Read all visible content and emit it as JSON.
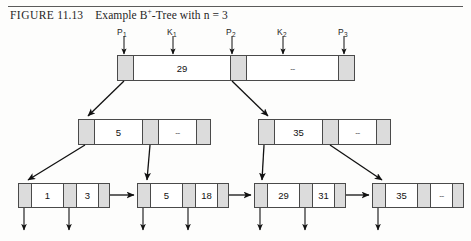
{
  "caption": {
    "figure_word": "FIGURE",
    "figure_number": "11.13",
    "title_pre": "Example B",
    "title_sup": "+",
    "title_post": "-Tree with n = 3"
  },
  "pointer_labels": [
    {
      "name": "P1",
      "text": "P",
      "sub": "1",
      "x": 117,
      "y": 27
    },
    {
      "name": "K1",
      "text": "K",
      "sub": "1",
      "x": 167,
      "y": 27
    },
    {
      "name": "P2",
      "text": "P",
      "sub": "2",
      "x": 226,
      "y": 27
    },
    {
      "name": "K2",
      "text": "K",
      "sub": "2",
      "x": 277,
      "y": 27
    },
    {
      "name": "P3",
      "text": "P",
      "sub": "3",
      "x": 338,
      "y": 27
    }
  ],
  "root": {
    "name": "root-node",
    "x": 117,
    "y": 55,
    "width": 238,
    "height": 26,
    "cells": [
      {
        "kind": "ptr",
        "label": "",
        "width": 16
      },
      {
        "kind": "val",
        "label": "29",
        "width": 97
      },
      {
        "kind": "ptr",
        "label": "",
        "width": 16
      },
      {
        "kind": "dash",
        "label": "--",
        "width": 92
      },
      {
        "kind": "ptr",
        "label": "",
        "width": 15
      }
    ]
  },
  "internal_nodes": [
    {
      "name": "internal-node-left",
      "x": 78,
      "y": 119,
      "width": 133,
      "height": 26,
      "cells": [
        {
          "kind": "ptr",
          "label": "",
          "width": 16
        },
        {
          "kind": "val",
          "label": "5",
          "width": 48
        },
        {
          "kind": "ptr",
          "label": "",
          "width": 16
        },
        {
          "kind": "dash",
          "label": "--",
          "width": 38
        },
        {
          "kind": "ptr",
          "label": "",
          "width": 13
        }
      ]
    },
    {
      "name": "internal-node-right",
      "x": 258,
      "y": 119,
      "width": 133,
      "height": 26,
      "cells": [
        {
          "kind": "ptr",
          "label": "",
          "width": 16
        },
        {
          "kind": "val",
          "label": "35",
          "width": 48
        },
        {
          "kind": "ptr",
          "label": "",
          "width": 16
        },
        {
          "kind": "dash",
          "label": "--",
          "width": 38
        },
        {
          "kind": "ptr",
          "label": "",
          "width": 13
        }
      ]
    }
  ],
  "leaf_nodes": [
    {
      "name": "leaf-node-1",
      "x": 18,
      "y": 183,
      "width": 92,
      "height": 25,
      "cells": [
        {
          "kind": "ptr",
          "label": "",
          "width": 13
        },
        {
          "kind": "val",
          "label": "1",
          "width": 32
        },
        {
          "kind": "ptr",
          "label": "",
          "width": 13
        },
        {
          "kind": "val",
          "label": "3",
          "width": 22
        },
        {
          "kind": "ptr",
          "label": "",
          "width": 10
        }
      ]
    },
    {
      "name": "leaf-node-2",
      "x": 137,
      "y": 183,
      "width": 92,
      "height": 25,
      "cells": [
        {
          "kind": "ptr",
          "label": "",
          "width": 13
        },
        {
          "kind": "val",
          "label": "5",
          "width": 32
        },
        {
          "kind": "ptr",
          "label": "",
          "width": 13
        },
        {
          "kind": "val",
          "label": "18",
          "width": 22
        },
        {
          "kind": "ptr",
          "label": "",
          "width": 10
        }
      ]
    },
    {
      "name": "leaf-node-3",
      "x": 254,
      "y": 183,
      "width": 92,
      "height": 25,
      "cells": [
        {
          "kind": "ptr",
          "label": "",
          "width": 13
        },
        {
          "kind": "val",
          "label": "29",
          "width": 32
        },
        {
          "kind": "ptr",
          "label": "",
          "width": 13
        },
        {
          "kind": "val",
          "label": "31",
          "width": 22
        },
        {
          "kind": "ptr",
          "label": "",
          "width": 10
        }
      ]
    },
    {
      "name": "leaf-node-4",
      "x": 372,
      "y": 183,
      "width": 92,
      "height": 25,
      "cells": [
        {
          "kind": "ptr",
          "label": "",
          "width": 13
        },
        {
          "kind": "val",
          "label": "35",
          "width": 32
        },
        {
          "kind": "ptr",
          "label": "",
          "width": 13
        },
        {
          "kind": "dash",
          "label": "--",
          "width": 22
        },
        {
          "kind": "ptr",
          "label": "",
          "width": 10
        }
      ]
    }
  ],
  "colors": {
    "pointer_fill": "#dcdcdc",
    "node_border": "#4a4a4a",
    "node_fill": "#ffffff",
    "arrow": "#111111",
    "rule": "#5a5a5a"
  }
}
